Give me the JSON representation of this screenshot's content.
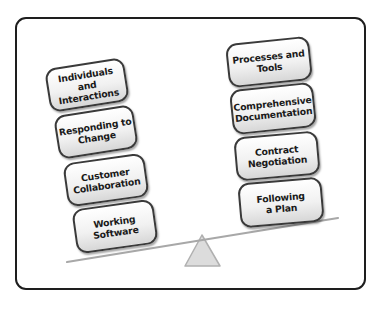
{
  "diagram": {
    "type": "balance-scale",
    "left_side": {
      "description": "Lower (heavier) side of the seesaw",
      "blocks": [
        {
          "label": "Individuals and\nInteractions"
        },
        {
          "label": "Responding to\nChange"
        },
        {
          "label": "Customer\nCollaboration"
        },
        {
          "label": "Working\nSoftware"
        }
      ]
    },
    "right_side": {
      "description": "Higher (lighter) side of the seesaw",
      "blocks": [
        {
          "label": "Processes and\nTools"
        },
        {
          "label": "Comprehensive\nDocumentation"
        },
        {
          "label": "Contract\nNegotiation"
        },
        {
          "label": "Following\na Plan"
        }
      ]
    },
    "colors": {
      "frame_border": "#1e1e1e",
      "block_border": "#3a3a3a",
      "block_fill_top": "#ffffff",
      "block_fill_bottom": "#d7d7d7",
      "plank": "#a8a8a8",
      "fulcrum_fill": "#dcdcdc",
      "fulcrum_stroke": "#b0b0b0",
      "ground_shadow": "#c8c8c8"
    }
  }
}
